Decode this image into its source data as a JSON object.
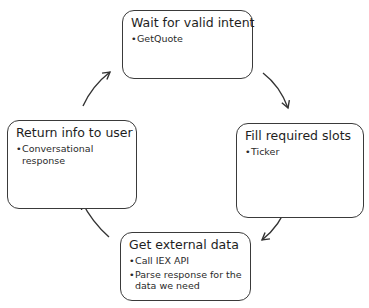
{
  "diagram": {
    "type": "cycle",
    "nodes": [
      {
        "id": "wait",
        "title": "Wait for valid intent",
        "bullets": [
          "GetQuote"
        ]
      },
      {
        "id": "fill",
        "title": "Fill required slots",
        "bullets": [
          "Ticker"
        ]
      },
      {
        "id": "external",
        "title": "Get external data",
        "bullets": [
          "Call IEX API",
          "Parse response for the data we need"
        ]
      },
      {
        "id": "return",
        "title": "Return info to user",
        "bullets": [
          "Conversational response"
        ]
      }
    ],
    "edges": [
      {
        "from": "wait",
        "to": "fill"
      },
      {
        "from": "fill",
        "to": "external"
      },
      {
        "from": "external",
        "to": "return"
      },
      {
        "from": "return",
        "to": "wait"
      }
    ],
    "colors": {
      "border": "#3a3a3a",
      "arrow": "#333333",
      "background": "#ffffff",
      "text": "#1e1e1e"
    }
  }
}
